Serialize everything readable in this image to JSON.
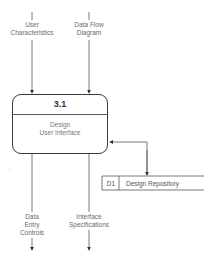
{
  "diagram": {
    "type": "data-flow-diagram",
    "process": {
      "id": "3.1",
      "name": "Design\nUser Interface"
    },
    "data_store": {
      "id": "D1",
      "name": "Design Repository"
    },
    "inputs": [
      {
        "label": "User\nCharacteristics"
      },
      {
        "label": "Data Flow\nDiagram"
      }
    ],
    "outputs": [
      {
        "label": "Data\nEntry\nControls"
      },
      {
        "label": "Interface\nSpecifications"
      }
    ],
    "connections": [
      {
        "from": "User Characteristics",
        "to": "3.1",
        "direction": "in"
      },
      {
        "from": "Data Flow Diagram",
        "to": "3.1",
        "direction": "in"
      },
      {
        "from": "3.1",
        "to": "D1",
        "direction": "bidirectional"
      },
      {
        "from": "3.1",
        "to": "Data Entry Controls",
        "direction": "out"
      },
      {
        "from": "3.1",
        "to": "Interface Specifications",
        "direction": "out"
      }
    ],
    "colors": {
      "line": "#3a3a3a",
      "text": "#6a6a6a",
      "background": "#ffffff"
    }
  }
}
